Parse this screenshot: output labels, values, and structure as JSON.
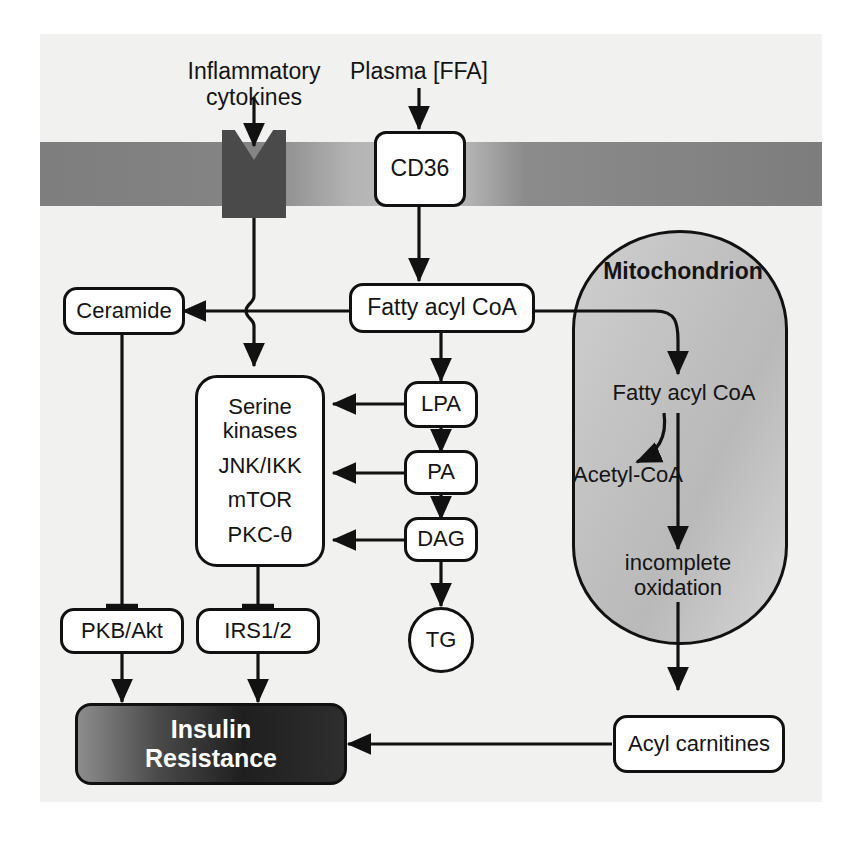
{
  "figure": {
    "background_color": "#f1f1ef",
    "line_color": "#111111",
    "membrane_color": "#8b8b8b",
    "receptor_color": "#4a4a4a",
    "mitochondrion_fill": "#c4c4c4",
    "insulin_resistance_fill": "#2b2b2b"
  },
  "labels": {
    "inflammatory_cytokines": "Inflammatory\ncytokines",
    "plasma_ffa": "Plasma [FFA]",
    "mitochondrion": "Mitochondrion",
    "mito_fatty_acyl_coa": "Fatty acyl CoA",
    "acetyl_coa": "Acetyl-CoA",
    "incomplete_oxidation": "incomplete\noxidation"
  },
  "nodes": {
    "cd36": "CD36",
    "fatty_acyl_coa": "Fatty acyl CoA",
    "ceramide": "Ceramide",
    "lpa": "LPA",
    "pa": "PA",
    "dag": "DAG",
    "tg": "TG",
    "pkb_akt": "PKB/Akt",
    "irs": "IRS1/2",
    "acyl_carnitines": "Acyl carnitines",
    "insulin_resistance": "Insulin\nResistance"
  },
  "serine_kinases_box": {
    "lines": [
      "Serine\nkinases",
      "JNK/IKK",
      "mTOR",
      "PKC-θ"
    ]
  },
  "edges": [
    {
      "from": "Plasma [FFA]",
      "to": "CD36",
      "kind": "arrow"
    },
    {
      "from": "Inflammatory cytokines",
      "to": "receptor",
      "kind": "arrow"
    },
    {
      "from": "receptor",
      "to": "Serine kinases",
      "kind": "arrow"
    },
    {
      "from": "CD36",
      "to": "Fatty acyl CoA",
      "kind": "arrow"
    },
    {
      "from": "Fatty acyl CoA",
      "to": "Ceramide",
      "kind": "arrow"
    },
    {
      "from": "Fatty acyl CoA",
      "to": "LPA",
      "kind": "arrow"
    },
    {
      "from": "Fatty acyl CoA",
      "to": "Mitochondrion Fatty acyl CoA",
      "kind": "arrow"
    },
    {
      "from": "LPA",
      "to": "PA",
      "kind": "arrow"
    },
    {
      "from": "PA",
      "to": "DAG",
      "kind": "arrow"
    },
    {
      "from": "DAG",
      "to": "TG",
      "kind": "arrow"
    },
    {
      "from": "LPA",
      "to": "Serine kinases",
      "kind": "arrow"
    },
    {
      "from": "PA",
      "to": "Serine kinases",
      "kind": "arrow"
    },
    {
      "from": "DAG",
      "to": "Serine kinases",
      "kind": "arrow"
    },
    {
      "from": "Ceramide",
      "to": "PKB/Akt",
      "kind": "inhibition"
    },
    {
      "from": "Serine kinases",
      "to": "IRS1/2",
      "kind": "inhibition"
    },
    {
      "from": "PKB/Akt",
      "to": "Insulin Resistance",
      "kind": "arrow"
    },
    {
      "from": "IRS1/2",
      "to": "Insulin Resistance",
      "kind": "arrow"
    },
    {
      "from": "Mitochondrion Fatty acyl CoA",
      "to": "Acetyl-CoA",
      "kind": "curved-arrow"
    },
    {
      "from": "Mitochondrion Fatty acyl CoA",
      "to": "incomplete oxidation",
      "kind": "arrow"
    },
    {
      "from": "incomplete oxidation",
      "to": "Acyl carnitines",
      "kind": "arrow"
    },
    {
      "from": "Acyl carnitines",
      "to": "Insulin Resistance",
      "kind": "arrow"
    }
  ]
}
